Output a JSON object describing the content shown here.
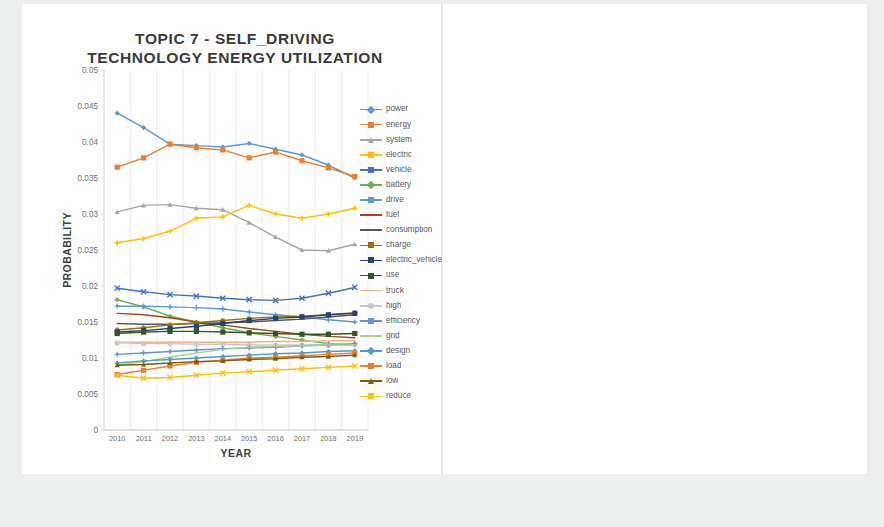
{
  "page": {
    "background": "#eceded",
    "panel_background": "#ffffff"
  },
  "chart_data": [
    {
      "type": "line",
      "title": "TOPIC 7 - SELF_DRIVING TECHNOLOGY ENERGY UTILIZATION",
      "title_lines": [
        "TOPIC 7 - SELF_DRIVING",
        "TECHNOLOGY ENERGY UTILIZATION"
      ],
      "xlabel": "YEAR",
      "ylabel": "PROBABILITY",
      "grid": true,
      "legend_position": "right",
      "categories": [
        "2010",
        "2011",
        "2012",
        "2013",
        "2014",
        "2015",
        "2016",
        "2017",
        "2018",
        "2019"
      ],
      "x": [
        2010,
        2011,
        2012,
        2013,
        2014,
        2015,
        2016,
        2017,
        2018,
        2019
      ],
      "ylim": [
        0,
        0.05
      ],
      "yticks": [
        "0",
        "0.005",
        "0.01",
        "0.015",
        "0.02",
        "0.025",
        "0.03",
        "0.035",
        "0.04",
        "0.045",
        "0.05"
      ],
      "ytick_values": [
        0,
        0.005,
        0.01,
        0.015,
        0.02,
        0.025,
        0.03,
        0.035,
        0.04,
        0.045,
        0.05
      ],
      "series": [
        {
          "name": "power",
          "color": "#5B9BD5",
          "marker": "diamond",
          "values": [
            0.044,
            0.042,
            0.0397,
            0.0395,
            0.0393,
            0.0398,
            0.039,
            0.0382,
            0.0368,
            0.035
          ]
        },
        {
          "name": "energy",
          "color": "#ED7D31",
          "marker": "square",
          "values": [
            0.0365,
            0.0378,
            0.0397,
            0.0392,
            0.0389,
            0.0378,
            0.0386,
            0.0374,
            0.0364,
            0.0352
          ]
        },
        {
          "name": "system",
          "color": "#A5A5A5",
          "marker": "triangle",
          "values": [
            0.0303,
            0.0312,
            0.0313,
            0.0308,
            0.0306,
            0.0288,
            0.0268,
            0.025,
            0.0249,
            0.0258
          ]
        },
        {
          "name": "electric",
          "color": "#FFC000",
          "marker": "cross",
          "values": [
            0.026,
            0.0266,
            0.0276,
            0.0294,
            0.0296,
            0.0312,
            0.03,
            0.0294,
            0.03,
            0.0308
          ]
        },
        {
          "name": "vehicle",
          "color": "#4472C4",
          "marker": "x",
          "values": [
            0.0197,
            0.0192,
            0.0188,
            0.0186,
            0.0183,
            0.0181,
            0.018,
            0.0183,
            0.019,
            0.0198
          ]
        },
        {
          "name": "battery",
          "color": "#70AD47",
          "marker": "diamond",
          "values": [
            0.0181,
            0.0171,
            0.0158,
            0.015,
            0.0142,
            0.0135,
            0.013,
            0.0125,
            0.012,
            0.0118
          ]
        },
        {
          "name": "drive",
          "color": "#5B9BD5",
          "marker": "plus",
          "values": [
            0.0172,
            0.0172,
            0.0171,
            0.017,
            0.0168,
            0.0164,
            0.016,
            0.0157,
            0.0153,
            0.015
          ]
        },
        {
          "name": "fuel",
          "color": "#A5451F",
          "marker": "line",
          "values": [
            0.0162,
            0.016,
            0.0156,
            0.015,
            0.0146,
            0.0141,
            0.0137,
            0.0133,
            0.013,
            0.0128
          ]
        },
        {
          "name": "consumption",
          "color": "#595959",
          "marker": "line",
          "values": [
            0.0148,
            0.0147,
            0.0147,
            0.0148,
            0.0149,
            0.015,
            0.0152,
            0.0154,
            0.0157,
            0.016
          ]
        },
        {
          "name": "charge",
          "color": "#997300",
          "marker": "star",
          "values": [
            0.0139,
            0.0142,
            0.0146,
            0.0149,
            0.0152,
            0.0155,
            0.0157,
            0.0158,
            0.016,
            0.0163
          ]
        },
        {
          "name": "electric_vehicle",
          "color": "#264478",
          "marker": "square",
          "values": [
            0.0136,
            0.0138,
            0.0141,
            0.0144,
            0.0148,
            0.0152,
            0.0155,
            0.0157,
            0.016,
            0.0162
          ]
        },
        {
          "name": "use",
          "color": "#375623",
          "marker": "square",
          "values": [
            0.0134,
            0.0136,
            0.0137,
            0.0137,
            0.0136,
            0.0135,
            0.0134,
            0.0133,
            0.0133,
            0.0134
          ]
        },
        {
          "name": "truck",
          "color": "#F4B183",
          "marker": "line",
          "values": [
            0.0122,
            0.0122,
            0.0122,
            0.0122,
            0.0122,
            0.0122,
            0.0123,
            0.0123,
            0.0124,
            0.0124
          ]
        },
        {
          "name": "high",
          "color": "#C9C9C9",
          "marker": "circle",
          "values": [
            0.0121,
            0.012,
            0.012,
            0.0119,
            0.0119,
            0.0118,
            0.0118,
            0.0118,
            0.0118,
            0.0119
          ]
        },
        {
          "name": "efficiency",
          "color": "#6A8FD6",
          "marker": "plus",
          "values": [
            0.0105,
            0.0107,
            0.0109,
            0.0111,
            0.0113,
            0.0114,
            0.0115,
            0.0117,
            0.0118,
            0.012
          ]
        },
        {
          "name": "grid",
          "color": "#A9D18E",
          "marker": "line",
          "values": [
            0.009,
            0.0095,
            0.0101,
            0.0107,
            0.0112,
            0.0115,
            0.0116,
            0.0117,
            0.0118,
            0.0118
          ]
        },
        {
          "name": "design",
          "color": "#4B9CD3",
          "marker": "diamond",
          "values": [
            0.0093,
            0.0096,
            0.0098,
            0.01,
            0.0102,
            0.0104,
            0.0106,
            0.0107,
            0.0109,
            0.011
          ]
        },
        {
          "name": "load",
          "color": "#ED7D31",
          "marker": "square",
          "values": [
            0.0077,
            0.0083,
            0.0089,
            0.0094,
            0.0097,
            0.01,
            0.0101,
            0.0103,
            0.0105,
            0.0107
          ]
        },
        {
          "name": "low",
          "color": "#7F6000",
          "marker": "triangle",
          "values": [
            0.009,
            0.0091,
            0.0093,
            0.0095,
            0.0096,
            0.0098,
            0.0099,
            0.0101,
            0.0102,
            0.0104
          ]
        },
        {
          "name": "reduce",
          "color": "#FFC000",
          "marker": "x",
          "values": [
            0.0076,
            0.0072,
            0.0073,
            0.0076,
            0.0079,
            0.0081,
            0.0083,
            0.0085,
            0.0087,
            0.0089
          ]
        }
      ]
    },
    {
      "type": "line",
      "title": "TOPIC 8 - NAVIGATION IN SELF-DRIVING",
      "title_lines": [
        "TOPIC 8 - NAVIGATION IN SELF-",
        "DRIVING"
      ],
      "xlabel": "YEAR",
      "ylabel": "PROBABILITY",
      "grid": true,
      "legend_position": "right",
      "categories": [
        "2010",
        "2011",
        "2012",
        "2013",
        "2014",
        "2015",
        "2016",
        "2017",
        "2018",
        "2019"
      ],
      "x": [
        2010,
        2011,
        2012,
        2013,
        2014,
        2015,
        2016,
        2017,
        2018,
        2019
      ],
      "ylim": [
        0,
        0.035
      ],
      "yticks": [
        "0",
        "0.005",
        "0.01",
        "0.015",
        "0.02",
        "0.025",
        "0.03",
        "0.035"
      ],
      "ytick_values": [
        0,
        0.005,
        0.01,
        0.015,
        0.02,
        0.025,
        0.03,
        0.035
      ],
      "series": [
        {
          "name": "lane",
          "color": "#5B9BD5",
          "marker": "diamond",
          "values": [
            0.031,
            0.0293,
            0.0268,
            0.0245,
            0.0222,
            0.0207,
            0.0196,
            0.0203,
            0.024,
            0.0295
          ]
        },
        {
          "name": "map",
          "color": "#ED7D31",
          "marker": "square",
          "values": [
            0.0278,
            0.028,
            0.0277,
            0.0277,
            0.0276,
            0.0287,
            0.026,
            0.0244,
            0.0229,
            0.0226
          ]
        },
        {
          "name": "position",
          "color": "#A5A5A5",
          "marker": "triangle",
          "values": [
            0.0262,
            0.0273,
            0.027,
            0.0255,
            0.0241,
            0.0228,
            0.0219,
            0.0212,
            0.0206,
            0.0203
          ]
        },
        {
          "name": "system",
          "color": "#FFC000",
          "marker": "cross",
          "values": [
            0.023,
            0.0226,
            0.022,
            0.0212,
            0.0203,
            0.0192,
            0.018,
            0.0168,
            0.0158,
            0.015
          ]
        },
        {
          "name": "use",
          "color": "#4472C4",
          "marker": "x",
          "values": [
            0.0222,
            0.0221,
            0.022,
            0.0218,
            0.0217,
            0.0215,
            0.0213,
            0.0211,
            0.0209,
            0.0208
          ]
        },
        {
          "name": "navigation",
          "color": "#70AD47",
          "marker": "diamond",
          "values": [
            0.0203,
            0.0205,
            0.0204,
            0.0204,
            0.0203,
            0.0203,
            0.0202,
            0.0201,
            0.02,
            0.0199
          ]
        },
        {
          "name": "drive",
          "color": "#264478",
          "marker": "plus",
          "values": [
            0.0152,
            0.0162,
            0.0175,
            0.019,
            0.0202,
            0.0204,
            0.0202,
            0.02,
            0.0198,
            0.0196
          ]
        },
        {
          "name": "vehicle",
          "color": "#843C0C",
          "marker": "line",
          "values": [
            0.0197,
            0.0198,
            0.0199,
            0.02,
            0.0201,
            0.0201,
            0.0202,
            0.0203,
            0.0203,
            0.0204
          ]
        },
        {
          "name": "method",
          "color": "#3B3838",
          "marker": "line",
          "values": [
            0.0158,
            0.0157,
            0.0157,
            0.0156,
            0.0156,
            0.0156,
            0.0156,
            0.0157,
            0.0157,
            0.0157
          ]
        },
        {
          "name": "self",
          "color": "#997300",
          "marker": "star",
          "values": [
            0.0155,
            0.0156,
            0.0157,
            0.0158,
            0.0158,
            0.0159,
            0.0159,
            0.016,
            0.016,
            0.0161
          ]
        },
        {
          "name": "base",
          "color": "#1F3864",
          "marker": "square",
          "values": [
            0.0143,
            0.0144,
            0.0145,
            0.0146,
            0.0147,
            0.0148,
            0.0149,
            0.0149,
            0.0148,
            0.0147
          ]
        },
        {
          "name": "self_driving",
          "color": "#375623",
          "marker": "square",
          "values": [
            0.0137,
            0.014,
            0.0145,
            0.015,
            0.0155,
            0.0157,
            0.0155,
            0.0152,
            0.015,
            0.0148
          ]
        },
        {
          "name": "localization",
          "color": "#9DC3E6",
          "marker": "line",
          "values": [
            0.0138,
            0.0139,
            0.014,
            0.0141,
            0.0143,
            0.0145,
            0.0146,
            0.0147,
            0.0148,
            0.0149
          ]
        },
        {
          "name": "information",
          "color": "#F4B183",
          "marker": "line",
          "values": [
            0.0141,
            0.014,
            0.0139,
            0.0138,
            0.0137,
            0.0136,
            0.0135,
            0.0134,
            0.0133,
            0.0133
          ]
        },
        {
          "name": "road",
          "color": "#BFBFBF",
          "marker": "circle",
          "values": [
            0.0126,
            0.0125,
            0.0124,
            0.0124,
            0.0125,
            0.0128,
            0.0134,
            0.0141,
            0.0148,
            0.0152
          ]
        },
        {
          "name": "gps",
          "color": "#FFD966",
          "marker": "line",
          "values": [
            0.0128,
            0.0126,
            0.0123,
            0.012,
            0.0118,
            0.0116,
            0.0117,
            0.012,
            0.0124,
            0.0128
          ]
        },
        {
          "name": "estimate",
          "color": "#8FAADC",
          "marker": "line",
          "values": [
            0.0122,
            0.0122,
            0.0121,
            0.0121,
            0.0121,
            0.0121,
            0.0122,
            0.0122,
            0.0123,
            0.0124
          ]
        },
        {
          "name": "estimation",
          "color": "#A9D18E",
          "marker": "line",
          "values": [
            0.012,
            0.012,
            0.0121,
            0.0121,
            0.0122,
            0.0122,
            0.0123,
            0.0124,
            0.0125,
            0.0126
          ]
        },
        {
          "name": "camera",
          "color": "#4B9CD3",
          "marker": "diamond",
          "values": [
            0.0118,
            0.0118,
            0.0119,
            0.012,
            0.0122,
            0.0125,
            0.013,
            0.0136,
            0.0142,
            0.0147
          ]
        },
        {
          "name": "sensor",
          "color": "#ED7D31",
          "marker": "square",
          "values": [
            0.0109,
            0.0112,
            0.0115,
            0.0118,
            0.0122,
            0.0126,
            0.0131,
            0.0136,
            0.0141,
            0.0146
          ]
        },
        {
          "name": "propose",
          "color": "#3B3838",
          "marker": "triangle",
          "values": [
            0.0111,
            0.011,
            0.0111,
            0.0112,
            0.0114,
            0.0116,
            0.0119,
            0.0122,
            0.0125,
            0.0128
          ]
        },
        {
          "name": "environment",
          "color": "#BF9000",
          "marker": "cross",
          "values": [
            0.0111,
            0.0111,
            0.0112,
            0.0113,
            0.0114,
            0.0116,
            0.0118,
            0.012,
            0.0122,
            0.0124
          ]
        },
        {
          "name": "algorithm",
          "color": "#2F5597",
          "marker": "line",
          "values": [
            0.011,
            0.0111,
            0.0112,
            0.0113,
            0.0115,
            0.0117,
            0.0119,
            0.0121,
            0.0123,
            0.0125
          ]
        }
      ]
    }
  ]
}
